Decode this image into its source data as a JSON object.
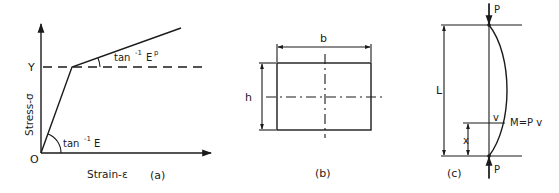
{
  "figure": {
    "panels": [
      {
        "id": "a",
        "caption": "(a)",
        "title": "Bilinear stress-strain curve",
        "y_axis_label": "Stress-σ",
        "x_axis_label": "Strain-ε",
        "origin_label": "O",
        "yield_label": "Y",
        "elastic_slope_label": "tan",
        "elastic_slope_sup": "-1",
        "elastic_slope_sym": "E",
        "plastic_slope_label": "tan",
        "plastic_slope_sup": "-1",
        "plastic_slope_sym": "E",
        "plastic_slope_sym_sup": "p"
      },
      {
        "id": "b",
        "caption": "(b)",
        "title": "Rectangular cross-section",
        "width_label": "b",
        "height_label": "h"
      },
      {
        "id": "c",
        "caption": "(c)",
        "title": "Pin-ended column under axial load",
        "load_top_label": "P",
        "load_bottom_label": "P",
        "length_label": "L",
        "position_label": "x",
        "deflection_label": "v",
        "moment_label": "M=P v"
      }
    ],
    "colors": {
      "ink": "#1a1a1a",
      "background": "#ffffff"
    }
  }
}
